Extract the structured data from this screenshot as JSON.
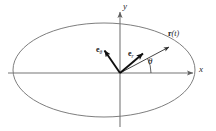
{
  "figure": {
    "caption_type": "polar-coordinate-orbit-diagram",
    "background_color": "#ffffff",
    "stroke_color": "#6e6e6e",
    "vector_color": "#111111",
    "axis": {
      "x_label": "x",
      "y_label": "y",
      "x_line": {
        "x1": 8,
        "y1": 73,
        "x2": 196,
        "y2": 73
      },
      "y_line": {
        "x1": 120,
        "y1": 9,
        "x2": 120,
        "y2": 127
      },
      "x_label_pos": {
        "x": 200,
        "y": 66
      },
      "y_label_pos": {
        "x": 124,
        "y": 4
      }
    },
    "orbit": {
      "shape": "ellipse",
      "center": {
        "cx": 104,
        "cy": 70
      },
      "radii": {
        "rx": 91,
        "ry": 47
      }
    },
    "origin": {
      "x": 120,
      "y": 73
    },
    "vectors": [
      {
        "name": "r",
        "label": "r(t)",
        "label_bold_part": "r",
        "label_italic_part": "(t)",
        "from": {
          "x": 120,
          "y": 73
        },
        "to": {
          "x": 172,
          "y": 45
        },
        "label_pos": {
          "x": 172,
          "y": 32
        }
      },
      {
        "name": "e_r",
        "label": "e",
        "subscript": "r",
        "from": {
          "x": 120,
          "y": 73
        },
        "to": {
          "x": 146,
          "y": 51
        },
        "label_pos": {
          "x": 130,
          "y": 52
        }
      },
      {
        "name": "e_theta",
        "label": "e",
        "subscript": "θ",
        "from": {
          "x": 102,
          "y": 47
        },
        "to": {
          "x": 120,
          "y": 73
        },
        "label_pos": {
          "x": 100,
          "y": 48
        }
      }
    ],
    "angle": {
      "symbol": "θ",
      "label_pos": {
        "x": 149,
        "y": 58
      },
      "arc": {
        "cx": 120,
        "cy": 73,
        "r": 31,
        "start_deg": 0,
        "end_deg": 28
      }
    }
  }
}
